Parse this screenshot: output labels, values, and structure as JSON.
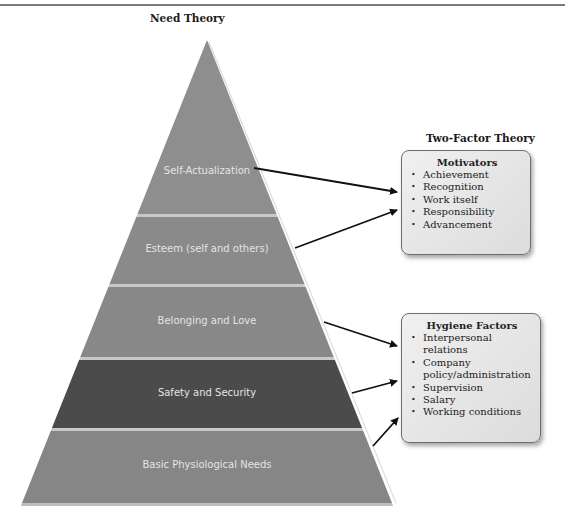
{
  "need_theory": {
    "title": "Need Theory",
    "layers": [
      {
        "label": "Self-Actualization",
        "color": "#8e8e8e"
      },
      {
        "label": "Esteem (self and others)",
        "color": "#8a8a8a"
      },
      {
        "label": "Belonging and Love",
        "color": "#888888"
      },
      {
        "label": "Safety and Security",
        "color": "#4b4b4b"
      },
      {
        "label": "Basic Physiological Needs",
        "color": "#868686"
      }
    ]
  },
  "two_factor_theory": {
    "title": "Two-Factor Theory",
    "motivators": {
      "title": "Motivators",
      "items": [
        "Achievement",
        "Recognition",
        "Work itself",
        "Responsibility",
        "Advancement"
      ]
    },
    "hygiene": {
      "title": "Hygiene Factors",
      "items": [
        "Interpersonal relations",
        "Company policy/administration",
        "Supervision",
        "Salary",
        "Working conditions"
      ]
    }
  },
  "bullet": "•",
  "connections": [
    {
      "from": "Self-Actualization",
      "to": "Motivators"
    },
    {
      "from": "Esteem (self and others)",
      "to": "Motivators"
    },
    {
      "from": "Belonging and Love",
      "to": "Hygiene Factors"
    },
    {
      "from": "Safety and Security",
      "to": "Hygiene Factors"
    },
    {
      "from": "Basic Physiological Needs",
      "to": "Hygiene Factors"
    }
  ]
}
